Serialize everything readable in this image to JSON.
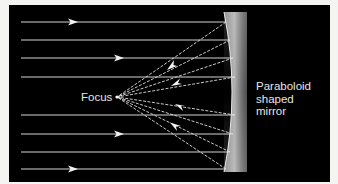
{
  "diagram": {
    "background_color": "#000000",
    "ray_color": "#d8d8d8",
    "labels": {
      "focus": "Focus",
      "mirror_line1": "Paraboloid",
      "mirror_line2": "shaped",
      "mirror_line3": "mirror"
    },
    "incoming_rays_y": [
      22,
      40,
      58,
      77,
      115,
      134,
      152,
      169
    ],
    "focus_point": {
      "x": 117,
      "y": 97
    },
    "mirror": {
      "left": 224,
      "right": 247,
      "top": 12,
      "bottom": 172
    }
  }
}
